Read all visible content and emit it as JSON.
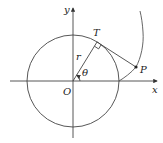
{
  "diagram": {
    "labels": {
      "y_axis": "y",
      "x_axis": "x",
      "origin": "O",
      "tangent_point": "T",
      "curve_point": "P",
      "radius": "r",
      "angle": "θ"
    },
    "geometry": {
      "center": [
        73,
        81
      ],
      "radius_px": 46,
      "theta_deg": 58,
      "T": [
        97,
        42
      ],
      "P": [
        136,
        67
      ]
    },
    "colors": {
      "line": "#444444",
      "text": "#222222",
      "background": "#ffffff"
    }
  }
}
